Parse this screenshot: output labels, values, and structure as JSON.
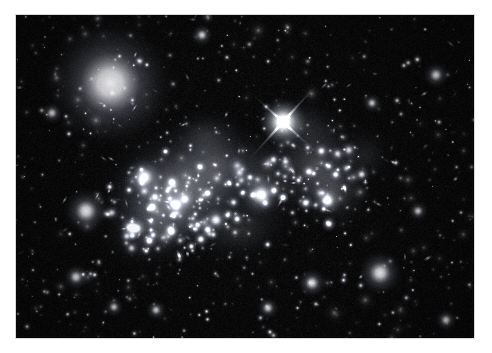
{
  "page": {
    "background_color": "#ffffff",
    "width": 492,
    "height": 353
  },
  "photo": {
    "frame": {
      "x": 16,
      "y": 15,
      "width": 458,
      "height": 323
    },
    "sky_color": "#000000",
    "alt_text": "Deep-field astronomical image of a merging galaxy cluster",
    "subject": "galaxy cluster merger",
    "palette": {
      "sky": "#000000",
      "faint_glow": "#3a4048",
      "diffuse_light": "#8d96a0",
      "star_core": "#ffffff",
      "galaxy_halo": "#c9d0d8",
      "noise": "#121418"
    }
  },
  "chart_data": {
    "type": "scatter",
    "title": "",
    "xlabel": "",
    "ylabel": "",
    "grid": false,
    "legend": "none",
    "xlim": [
      0,
      458
    ],
    "ylim": [
      0,
      323
    ],
    "note": "Positions are in photo-frame pixel coordinates; r = radius px; b = peak brightness 0-1",
    "diffuse_halos": [
      {
        "cx": 170,
        "cy": 175,
        "rx": 98,
        "ry": 78,
        "b": 0.3,
        "rot": -12
      },
      {
        "cx": 150,
        "cy": 185,
        "rx": 70,
        "ry": 58,
        "b": 0.26,
        "rot": -8
      },
      {
        "cx": 200,
        "cy": 150,
        "rx": 62,
        "ry": 50,
        "b": 0.22,
        "rot": 10
      },
      {
        "cx": 300,
        "cy": 150,
        "rx": 56,
        "ry": 62,
        "b": 0.26,
        "rot": 18
      },
      {
        "cx": 318,
        "cy": 175,
        "rx": 44,
        "ry": 46,
        "b": 0.2,
        "rot": 5
      },
      {
        "cx": 250,
        "cy": 165,
        "rx": 48,
        "ry": 60,
        "b": 0.16,
        "rot": 0
      },
      {
        "cx": 135,
        "cy": 215,
        "rx": 58,
        "ry": 42,
        "b": 0.18,
        "rot": -20
      },
      {
        "cx": 225,
        "cy": 215,
        "rx": 55,
        "ry": 38,
        "b": 0.14,
        "rot": -6
      },
      {
        "cx": 285,
        "cy": 110,
        "rx": 46,
        "ry": 34,
        "b": 0.13,
        "rot": 14
      },
      {
        "cx": 350,
        "cy": 140,
        "rx": 32,
        "ry": 34,
        "b": 0.1,
        "rot": 0
      },
      {
        "cx": 190,
        "cy": 120,
        "rx": 44,
        "ry": 30,
        "b": 0.12,
        "rot": -5
      }
    ],
    "bright_star": {
      "cx": 267,
      "cy": 107,
      "r": 7.5,
      "b": 1.0,
      "spikes": 4,
      "spike_length": 62,
      "spike_angle": 42,
      "name": "foreground-star-with-diffraction-spikes"
    },
    "big_galaxies": [
      {
        "cx": 94,
        "cy": 68,
        "r": 15.5,
        "b": 0.98,
        "fuzz": 2.2
      },
      {
        "cx": 128,
        "cy": 162,
        "r": 7.0,
        "b": 0.95,
        "fuzz": 1.5
      },
      {
        "cx": 70,
        "cy": 196,
        "r": 7.5,
        "b": 0.95,
        "fuzz": 1.6
      },
      {
        "cx": 245,
        "cy": 180,
        "r": 7.5,
        "b": 0.96,
        "fuzz": 1.5
      },
      {
        "cx": 312,
        "cy": 186,
        "r": 5.5,
        "b": 0.92,
        "fuzz": 1.4
      },
      {
        "cx": 364,
        "cy": 258,
        "r": 8.0,
        "b": 0.95,
        "fuzz": 1.5
      },
      {
        "cx": 296,
        "cy": 268,
        "r": 5.5,
        "b": 0.9,
        "fuzz": 1.4
      },
      {
        "cx": 420,
        "cy": 60,
        "r": 5.0,
        "b": 0.9,
        "fuzz": 1.4
      },
      {
        "cx": 186,
        "cy": 20,
        "r": 4.5,
        "b": 0.88,
        "fuzz": 1.3
      },
      {
        "cx": 36,
        "cy": 98,
        "r": 4.5,
        "b": 0.88,
        "fuzz": 1.3
      },
      {
        "cx": 252,
        "cy": 293,
        "r": 4.5,
        "b": 0.86,
        "fuzz": 1.3
      },
      {
        "cx": 98,
        "cy": 292,
        "r": 4.0,
        "b": 0.85,
        "fuzz": 1.3
      },
      {
        "cx": 430,
        "cy": 305,
        "r": 4.5,
        "b": 0.88,
        "fuzz": 1.3
      },
      {
        "cx": 160,
        "cy": 190,
        "r": 5.5,
        "b": 0.93,
        "fuzz": 1.4
      },
      {
        "cx": 200,
        "cy": 205,
        "r": 5.0,
        "b": 0.92,
        "fuzz": 1.4
      },
      {
        "cx": 116,
        "cy": 213,
        "r": 5.2,
        "b": 0.93,
        "fuzz": 1.4
      },
      {
        "cx": 60,
        "cy": 262,
        "r": 5.0,
        "b": 0.9,
        "fuzz": 1.4
      },
      {
        "cx": 140,
        "cy": 295,
        "r": 4.2,
        "b": 0.86,
        "fuzz": 1.3
      },
      {
        "cx": 402,
        "cy": 196,
        "r": 4.2,
        "b": 0.86,
        "fuzz": 1.3
      },
      {
        "cx": 356,
        "cy": 88,
        "r": 4.0,
        "b": 0.85,
        "fuzz": 1.3
      }
    ],
    "cluster_members": {
      "left_core": {
        "cx": 150,
        "cy": 190,
        "rx": 62,
        "ry": 54,
        "count": 110
      },
      "right_core": {
        "cx": 305,
        "cy": 160,
        "rx": 50,
        "ry": 52,
        "count": 55
      },
      "bridge": {
        "cx": 230,
        "cy": 175,
        "rx": 60,
        "ry": 40,
        "count": 45
      }
    },
    "field_counts": {
      "background_stars": 430,
      "faint_galaxies": 160,
      "edge_on_streaks": 70
    }
  }
}
